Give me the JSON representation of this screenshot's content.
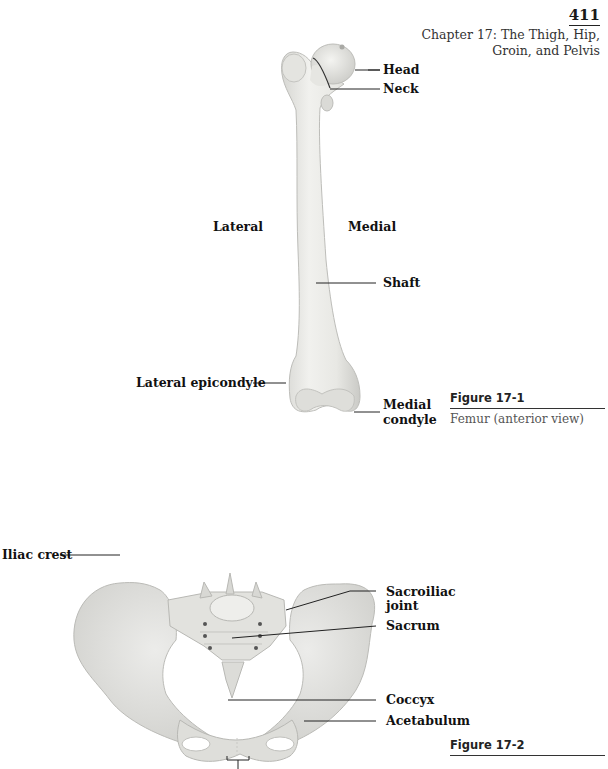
{
  "header": {
    "page_number": "411",
    "chapter_title": "Chapter 17: The Thigh, Hip, Groin, and Pelvis"
  },
  "figure_1": {
    "title": "Figure 17-1",
    "caption": "Femur (anterior view)",
    "image": "femur-anterior-illustration",
    "orientation_labels": {
      "left": "Lateral",
      "right": "Medial"
    },
    "labels": {
      "head": "Head",
      "neck": "Neck",
      "shaft": "Shaft",
      "lateral_epicondyle": "Lateral epicondyle",
      "medial_condyle_line1": "Medial",
      "medial_condyle_line2": "condyle"
    }
  },
  "figure_2": {
    "title": "Figure 17-2",
    "image": "pelvis-anterior-illustration",
    "labels": {
      "iliac_crest": "Iliac crest",
      "sacroiliac_joint_line1": "Sacroiliac",
      "sacroiliac_joint_line2": "joint",
      "sacrum": "Sacrum",
      "coccyx": "Coccyx",
      "acetabulum": "Acetabulum"
    }
  },
  "colors": {
    "bone_fill": "#e9e9e6",
    "bone_shade": "#cfcfcb",
    "bone_outline": "#b9b9b5",
    "text": "#111111",
    "caption": "#555555"
  }
}
